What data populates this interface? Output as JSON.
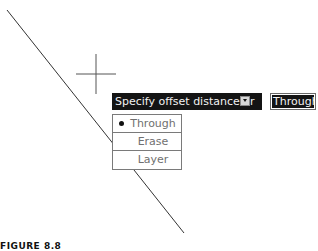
{
  "canvas": {
    "background": "#ffffff",
    "line": {
      "x1": 7,
      "y1": 10,
      "x2": 184,
      "y2": 233,
      "color": "#333333"
    },
    "crosshair": {
      "cx": 96,
      "cy": 74,
      "half_size": 20,
      "color": "#555555"
    }
  },
  "prompt": {
    "text": "Specify offset distance or",
    "icon": "down-arrow-icon",
    "background": "#141414",
    "text_color": "#f2f2f2"
  },
  "input": {
    "value": "Through"
  },
  "menu": {
    "items": [
      {
        "label": "Through",
        "selected": true
      },
      {
        "label": "Erase",
        "selected": false
      },
      {
        "label": "Layer",
        "selected": false
      }
    ]
  },
  "caption": {
    "text": "FIGURE 8.8"
  }
}
